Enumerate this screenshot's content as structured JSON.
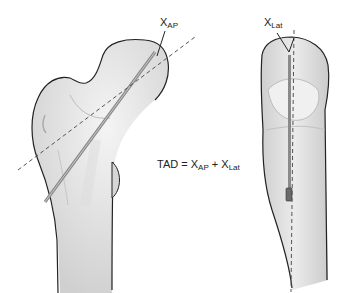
{
  "figure": {
    "views": [
      {
        "name": "anteroposterior view",
        "label_main": "X",
        "label_sub": "AP"
      },
      {
        "name": "lateral view",
        "label_main": "X",
        "label_sub": "Lat"
      }
    ],
    "formula": {
      "lhs": "TAD = ",
      "term1_main": "X",
      "term1_sub": "AP",
      "plus": " + ",
      "term2_main": "X",
      "term2_sub": "Lat"
    },
    "colors": {
      "bone_fill": "#e2e2e2",
      "bone_outline": "#222222",
      "screw": "#8a8a8a",
      "dashed_axis": "#555555"
    }
  }
}
